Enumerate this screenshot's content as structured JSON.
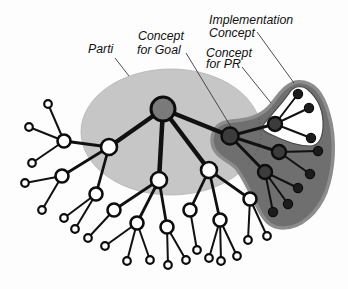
{
  "diagram": {
    "colors": {
      "parti_fill": "#c6c6c6",
      "goal_region_fill": "#6f6f6f",
      "goal_region_rim": "#8c8c8c",
      "impl_region_fill": "#ffffff",
      "edge": "#111111",
      "leader": "#3a3a3a",
      "root_fill": "#7a7a7a",
      "dark_node_fill": "#3c3c3c",
      "dark_leaf_fill": "#1c1c1c",
      "open_node_fill": "#ffffff"
    },
    "labels": {
      "parti": "Parti",
      "goal_line1": "Concept",
      "goal_line2": "for Goal",
      "impl_line1": "Implementation",
      "impl_line2": "Concept",
      "pr_line1": "Concept",
      "pr_line2": "for PR"
    },
    "regions": {
      "parti": {
        "cx": 171,
        "cy": 132,
        "rx": 90,
        "ry": 63
      },
      "goal": "M212,140 C212,128 220,122 232,121 C245,120 258,118 268,108 C276,100 282,86 296,82 C314,80 324,96 329,115 C336,140 334,170 326,192 C318,212 302,228 283,228 C270,228 264,220 258,208 C250,192 244,178 236,168 C228,160 212,156 212,140 Z",
      "implementation": "M264,124 C270,116 282,104 290,92 C294,86 302,85 307,89 C318,98 324,112 323,128 C322,140 318,146 310,146 C298,146 282,140 272,135 C265,132 260,130 264,124 Z",
      "parti_hidden_edge": "M258.7,118 A90,63 0 0 1 246.8,166"
    },
    "leader_lines": [
      {
        "name": "leader-parti",
        "x1": 115,
        "y1": 58,
        "x2": 129,
        "y2": 76
      },
      {
        "name": "leader-concept-for-goal",
        "x1": 186,
        "y1": 53,
        "x2": 231,
        "y2": 127
      },
      {
        "name": "leader-concept-for-pr",
        "x1": 242,
        "y1": 67,
        "x2": 271,
        "y2": 103
      },
      {
        "name": "leader-implementation-concept",
        "x1": 257,
        "y1": 32,
        "x2": 294,
        "y2": 83
      }
    ],
    "nodes": [
      {
        "id": "root",
        "x": 163,
        "y": 109,
        "r": 12,
        "kind": "root"
      },
      {
        "id": "pr",
        "x": 230,
        "y": 136,
        "r": 8.5,
        "kind": "dark"
      },
      {
        "id": "impl",
        "x": 275,
        "y": 124,
        "r": 7,
        "kind": "dark"
      },
      {
        "id": "b",
        "x": 279,
        "y": 152,
        "r": 7,
        "kind": "dark"
      },
      {
        "id": "c",
        "x": 265,
        "y": 172,
        "r": 7,
        "kind": "dark"
      },
      {
        "id": "i1",
        "x": 298,
        "y": 94,
        "r": 4.6,
        "kind": "dark-leaf"
      },
      {
        "id": "i2",
        "x": 309,
        "y": 108,
        "r": 4.6,
        "kind": "dark-leaf"
      },
      {
        "id": "i3",
        "x": 311,
        "y": 138,
        "r": 4.6,
        "kind": "dark-leaf"
      },
      {
        "id": "b1",
        "x": 318,
        "y": 151,
        "r": 4.6,
        "kind": "dark-leaf"
      },
      {
        "id": "b2",
        "x": 310,
        "y": 174,
        "r": 4.6,
        "kind": "dark-leaf"
      },
      {
        "id": "c1",
        "x": 298,
        "y": 188,
        "r": 4.6,
        "kind": "dark-leaf"
      },
      {
        "id": "c2",
        "x": 288,
        "y": 204,
        "r": 4.6,
        "kind": "dark-leaf"
      },
      {
        "id": "c3",
        "x": 273,
        "y": 212,
        "r": 4.6,
        "kind": "dark-leaf"
      },
      {
        "id": "m1",
        "x": 109,
        "y": 147,
        "r": 8,
        "kind": "open"
      },
      {
        "id": "m2",
        "x": 159,
        "y": 180,
        "r": 8,
        "kind": "open"
      },
      {
        "id": "m3",
        "x": 209,
        "y": 170,
        "r": 8,
        "kind": "open"
      },
      {
        "id": "l1",
        "x": 64,
        "y": 141,
        "r": 6.5,
        "kind": "open"
      },
      {
        "id": "l2",
        "x": 62,
        "y": 176,
        "r": 6.5,
        "kind": "open"
      },
      {
        "id": "n1",
        "x": 96,
        "y": 194,
        "r": 6.5,
        "kind": "open"
      },
      {
        "id": "n2",
        "x": 114,
        "y": 210,
        "r": 6.5,
        "kind": "open"
      },
      {
        "id": "n3",
        "x": 137,
        "y": 223,
        "r": 6.5,
        "kind": "open"
      },
      {
        "id": "n4",
        "x": 167,
        "y": 227,
        "r": 6.5,
        "kind": "open"
      },
      {
        "id": "n5",
        "x": 190,
        "y": 210,
        "r": 6.5,
        "kind": "open"
      },
      {
        "id": "n6",
        "x": 220,
        "y": 220,
        "r": 6.5,
        "kind": "open"
      },
      {
        "id": "n7",
        "x": 250,
        "y": 199,
        "r": 6.5,
        "kind": "open"
      },
      {
        "id": "a1",
        "x": 48,
        "y": 104,
        "r": 3.8,
        "kind": "leaf"
      },
      {
        "id": "a2",
        "x": 29,
        "y": 127,
        "r": 3.8,
        "kind": "leaf"
      },
      {
        "id": "a3",
        "x": 32,
        "y": 163,
        "r": 3.8,
        "kind": "leaf"
      },
      {
        "id": "a4",
        "x": 25,
        "y": 183,
        "r": 3.8,
        "kind": "leaf"
      },
      {
        "id": "a5",
        "x": 42,
        "y": 210,
        "r": 3.8,
        "kind": "leaf"
      },
      {
        "id": "a6",
        "x": 64,
        "y": 218,
        "r": 3.8,
        "kind": "leaf"
      },
      {
        "id": "a7",
        "x": 75,
        "y": 229,
        "r": 3.8,
        "kind": "leaf"
      },
      {
        "id": "a8",
        "x": 88,
        "y": 238,
        "r": 3.8,
        "kind": "leaf"
      },
      {
        "id": "a9",
        "x": 105,
        "y": 246,
        "r": 3.8,
        "kind": "leaf"
      },
      {
        "id": "a10",
        "x": 127,
        "y": 261,
        "r": 3.8,
        "kind": "leaf"
      },
      {
        "id": "a11",
        "x": 150,
        "y": 260,
        "r": 3.8,
        "kind": "leaf"
      },
      {
        "id": "a12",
        "x": 168,
        "y": 265,
        "r": 3.8,
        "kind": "leaf"
      },
      {
        "id": "a13",
        "x": 186,
        "y": 260,
        "r": 3.8,
        "kind": "leaf"
      },
      {
        "id": "a14",
        "x": 197,
        "y": 250,
        "r": 3.8,
        "kind": "leaf"
      },
      {
        "id": "a15",
        "x": 209,
        "y": 258,
        "r": 3.8,
        "kind": "leaf"
      },
      {
        "id": "a16",
        "x": 221,
        "y": 261,
        "r": 3.8,
        "kind": "leaf"
      },
      {
        "id": "a17",
        "x": 237,
        "y": 256,
        "r": 3.8,
        "kind": "leaf"
      },
      {
        "id": "a18",
        "x": 248,
        "y": 240,
        "r": 3.8,
        "kind": "leaf"
      },
      {
        "id": "a19",
        "x": 267,
        "y": 236,
        "r": 3.8,
        "kind": "leaf"
      }
    ],
    "edges": [
      [
        "root",
        "m1",
        4.5
      ],
      [
        "root",
        "m2",
        4.5
      ],
      [
        "root",
        "m3",
        4.5
      ],
      [
        "root",
        "pr",
        4.5
      ],
      [
        "pr",
        "impl",
        3
      ],
      [
        "pr",
        "b",
        3
      ],
      [
        "pr",
        "c",
        3
      ],
      [
        "impl",
        "i1",
        2
      ],
      [
        "impl",
        "i2",
        2
      ],
      [
        "impl",
        "i3",
        2
      ],
      [
        "b",
        "b1",
        2
      ],
      [
        "b",
        "b2",
        2
      ],
      [
        "c",
        "c1",
        2
      ],
      [
        "c",
        "c2",
        2
      ],
      [
        "c",
        "c3",
        2
      ],
      [
        "m1",
        "l1",
        2.8
      ],
      [
        "m1",
        "l2",
        2.8
      ],
      [
        "m1",
        "n1",
        2.8
      ],
      [
        "m2",
        "n2",
        2.8
      ],
      [
        "m2",
        "n3",
        2.8
      ],
      [
        "m2",
        "n4",
        2.8
      ],
      [
        "m3",
        "n5",
        2.8
      ],
      [
        "m3",
        "n6",
        2.8
      ],
      [
        "m3",
        "n7",
        2.8
      ],
      [
        "l1",
        "a1",
        2
      ],
      [
        "l1",
        "a2",
        2
      ],
      [
        "l1",
        "a3",
        2
      ],
      [
        "l2",
        "a4",
        2
      ],
      [
        "l2",
        "a5",
        2
      ],
      [
        "n1",
        "a6",
        2
      ],
      [
        "n1",
        "a7",
        2
      ],
      [
        "n2",
        "a8",
        2
      ],
      [
        "n3",
        "a9",
        2
      ],
      [
        "n3",
        "a10",
        2
      ],
      [
        "n3",
        "a11",
        2
      ],
      [
        "n4",
        "a12",
        2
      ],
      [
        "n4",
        "a13",
        2
      ],
      [
        "n5",
        "a14",
        2
      ],
      [
        "n6",
        "a15",
        2
      ],
      [
        "n6",
        "a16",
        2
      ],
      [
        "n6",
        "a17",
        2
      ],
      [
        "n7",
        "a18",
        2
      ],
      [
        "n7",
        "a19",
        2
      ]
    ]
  }
}
